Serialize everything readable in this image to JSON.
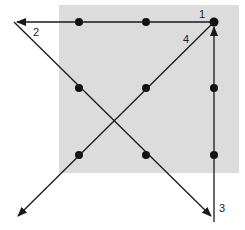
{
  "diagram": {
    "background_square": {
      "x": 59,
      "y": 5,
      "w": 180,
      "h": 168,
      "color": "#dcdcdc"
    },
    "dots": [
      {
        "x": 79,
        "y": 22
      },
      {
        "x": 146,
        "y": 22
      },
      {
        "x": 214,
        "y": 22
      },
      {
        "x": 79,
        "y": 88
      },
      {
        "x": 146,
        "y": 88
      },
      {
        "x": 214,
        "y": 88
      },
      {
        "x": 79,
        "y": 155
      },
      {
        "x": 146,
        "y": 155
      },
      {
        "x": 214,
        "y": 155
      }
    ],
    "lines": [
      {
        "id": "1",
        "label": "1",
        "from": [
          214,
          22
        ],
        "to": [
          16,
          22
        ]
      },
      {
        "id": "2",
        "label": "2",
        "from": [
          14,
          22
        ],
        "to": [
          211,
          216
        ]
      },
      {
        "id": "3",
        "label": "3",
        "from": [
          214,
          222
        ],
        "to": [
          214,
          26
        ]
      },
      {
        "id": "4",
        "label": "4",
        "from": [
          214,
          22
        ],
        "to": [
          18,
          216
        ]
      }
    ],
    "labels": {
      "one": "1",
      "two": "2",
      "three": "3",
      "four": "4"
    },
    "colors": {
      "line": "#1a1a1a",
      "dot": "#111111",
      "square": "#dcdcdc"
    }
  }
}
